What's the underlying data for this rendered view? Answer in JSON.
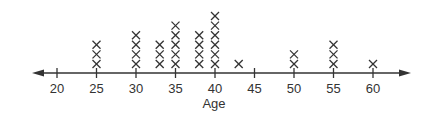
{
  "chart_data": {
    "type": "scatter",
    "subtype": "dot-plot",
    "title": "",
    "xlabel": "Age",
    "ylabel": "",
    "marker": "X",
    "xlim": [
      16,
      65
    ],
    "x_ticks": [
      20,
      25,
      30,
      35,
      40,
      45,
      50,
      55,
      60
    ],
    "x_tick_labels": [
      "20",
      "25",
      "30",
      "35",
      "40",
      "45",
      "50",
      "55",
      "60"
    ],
    "grid": false,
    "legend": null,
    "points": [
      {
        "x": 25,
        "count": 3
      },
      {
        "x": 30,
        "count": 4
      },
      {
        "x": 33,
        "count": 3
      },
      {
        "x": 35,
        "count": 5
      },
      {
        "x": 38,
        "count": 4
      },
      {
        "x": 40,
        "count": 6
      },
      {
        "x": 43,
        "count": 1
      },
      {
        "x": 50,
        "count": 2
      },
      {
        "x": 55,
        "count": 3
      },
      {
        "x": 60,
        "count": 1
      }
    ],
    "axis_arrows": "both-ends"
  },
  "colors": {
    "ink": "#333333",
    "background": "#ffffff"
  }
}
